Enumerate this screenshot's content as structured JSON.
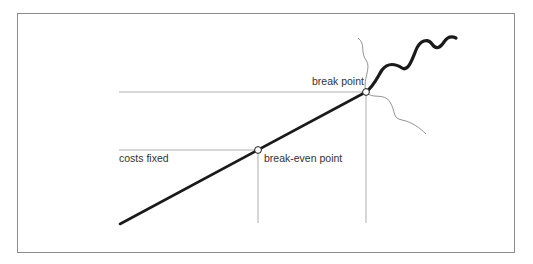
{
  "diagram": {
    "type": "break-even concept diagram",
    "labels": {
      "costs_fixed": "costs fixed",
      "break_even_point": "break-even point",
      "break_point": "break point"
    },
    "elements": [
      {
        "name": "rising-line",
        "description": "thick straight line rising left to right"
      },
      {
        "name": "break-even-marker",
        "description": "open circle on the line where fixed costs are met"
      },
      {
        "name": "break-point-marker",
        "description": "open circle where the line turns into a wave"
      },
      {
        "name": "wavy-continuation",
        "description": "thick wavy line beyond the break point"
      },
      {
        "name": "thin-wavy-branches",
        "description": "two thin wavy lines passing through the break point"
      }
    ],
    "colors": {
      "line": "#1a1a1a",
      "guide": "#9a9a9a",
      "frame": "#8c8c8c",
      "text": "#333333"
    }
  }
}
